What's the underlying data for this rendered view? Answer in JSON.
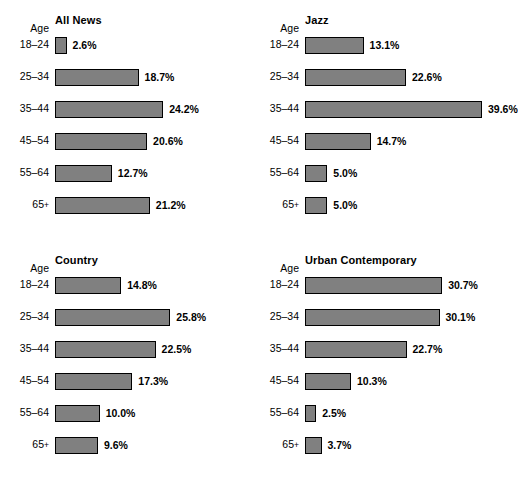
{
  "figure": {
    "axis_header": "Age",
    "bar_fill_color": "#808080",
    "bar_border_color": "#000000",
    "background_color": "#ffffff"
  },
  "chart_data": {
    "type": "bar",
    "orientation": "horizontal",
    "title": "",
    "xlabel": "",
    "ylabel": "Age",
    "categories": [
      "18–24",
      "25–34",
      "35–44",
      "45–54",
      "55–64",
      "65+"
    ],
    "grid": false,
    "legend": "none",
    "xlim": [
      0,
      39.6
    ],
    "value_format": "percent_one_decimal",
    "panels": [
      {
        "title": "All News",
        "position": "top-left",
        "values": [
          2.6,
          18.7,
          24.2,
          20.6,
          12.7,
          21.2
        ],
        "labels": [
          "2.6%",
          "18.7%",
          "24.2%",
          "20.6%",
          "12.7%",
          "21.2%"
        ]
      },
      {
        "title": "Jazz",
        "position": "top-right",
        "values": [
          13.1,
          22.6,
          39.6,
          14.7,
          5.0,
          5.0
        ],
        "labels": [
          "13.1%",
          "22.6%",
          "39.6%",
          "14.7%",
          "5.0%",
          "5.0%"
        ]
      },
      {
        "title": "Country",
        "position": "bottom-left",
        "values": [
          14.8,
          25.8,
          22.5,
          17.3,
          10.0,
          9.6
        ],
        "labels": [
          "14.8%",
          "25.8%",
          "22.5%",
          "17.3%",
          "10.0%",
          "9.6%"
        ]
      },
      {
        "title": "Urban Contemporary",
        "position": "bottom-right",
        "values": [
          30.7,
          30.1,
          22.7,
          10.3,
          2.5,
          3.7
        ],
        "labels": [
          "30.7%",
          "30.1%",
          "22.7%",
          "10.3%",
          "2.5%",
          "3.7%"
        ]
      }
    ]
  }
}
